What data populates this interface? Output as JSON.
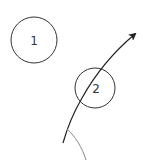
{
  "diagram": {
    "nodes": [
      {
        "id": "node-1",
        "label": "1",
        "cx": 34,
        "cy": 40,
        "r": 23
      },
      {
        "id": "node-2",
        "label": "2",
        "cx": 95,
        "cy": 88,
        "r": 20
      }
    ],
    "trajectory": {
      "path": "M63,143 C68,125 75,110 82,98 C92,80 110,55 135,34",
      "color": "#222222",
      "arrowhead": "end"
    },
    "arc": {
      "path": "M67,129 C75,136 82,147 86,160",
      "color": "#888888"
    },
    "colors": {
      "stroke": "#333333",
      "background": "#ffffff"
    }
  }
}
